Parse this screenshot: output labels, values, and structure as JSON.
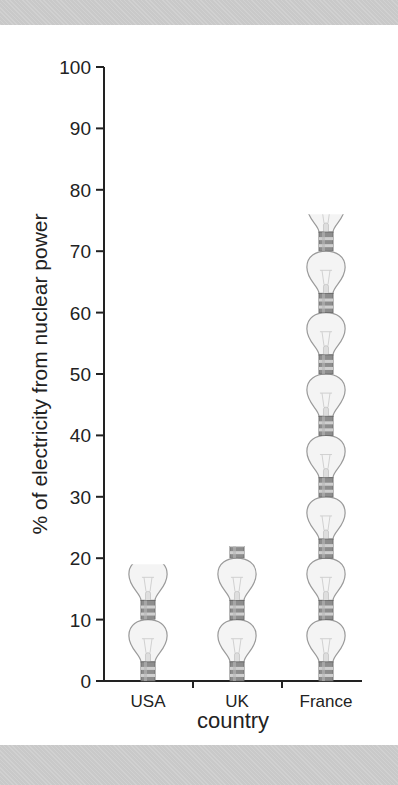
{
  "chart_data": {
    "type": "bar",
    "title": "",
    "xlabel": "country",
    "ylabel": "% of electricity from nuclear power",
    "categories": [
      "USA",
      "UK",
      "France"
    ],
    "values": [
      19,
      22,
      76
    ],
    "ylim": [
      0,
      100
    ],
    "yticks": [
      0,
      10,
      20,
      30,
      40,
      50,
      60,
      70,
      80,
      90,
      100
    ],
    "grid": false,
    "legend": null,
    "style": "pictogram",
    "pictogram_unit": 10,
    "pictogram_icon": "light-bulb-icon"
  },
  "colors": {
    "axis": "#222222",
    "band": "#c9c9c9",
    "bulb_glass": "#f4f4f4",
    "bulb_outline": "#9a9a9a",
    "bulb_base": "#8d8d8d"
  }
}
